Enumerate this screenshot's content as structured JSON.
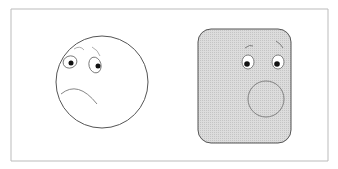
{
  "figure": {
    "panels": [
      {
        "label": "sad-round-face",
        "expression": "sad"
      },
      {
        "label": "surprised-square-face",
        "expression": "surprised"
      }
    ],
    "colors": {
      "line": "#555555",
      "fill_shaded": "#d4d4d4",
      "frame": "#bbbbbb",
      "background": "#ffffff"
    }
  }
}
